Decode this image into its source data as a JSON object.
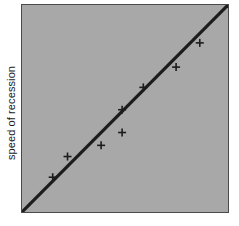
{
  "figure": {
    "background_color": "#ffffff",
    "plot_background_color": "#a8a8a8",
    "frame_color": "#4a4a4a",
    "ink_color": "#1c1c1c"
  },
  "axes": {
    "ylabel": "speed of recession",
    "xlabel": "",
    "tick_labels_x": [],
    "tick_labels_y": []
  },
  "chart_data": {
    "type": "scatter",
    "title": "",
    "xlabel": "",
    "ylabel": "speed of recession",
    "xlim": [
      0,
      100
    ],
    "ylim": [
      0,
      100
    ],
    "grid": false,
    "legend": false,
    "marker": "plus",
    "series": [
      {
        "name": "observations",
        "marker": "+",
        "x": [
          14.9,
          22.1,
          38.4,
          48.6,
          48.6,
          58.9,
          74.8,
          86.3
        ],
        "y": [
          16.8,
          26.8,
          32.2,
          38.4,
          49.4,
          60.2,
          70.0,
          81.7
        ]
      },
      {
        "name": "fit line",
        "type": "line",
        "x": [
          0,
          100
        ],
        "y": [
          0,
          100
        ]
      }
    ],
    "annotations": []
  }
}
